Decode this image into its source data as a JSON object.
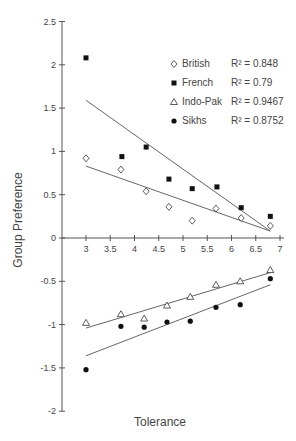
{
  "chart_data": {
    "type": "scatter",
    "title": "",
    "xlabel": "Tolerance",
    "ylabel": "Group Preference",
    "xlim": [
      2.5,
      7
    ],
    "ylim": [
      -2,
      2.5
    ],
    "x_ticks": [
      "3",
      "3.5",
      "4",
      "4.5",
      "5",
      "5.5",
      "6",
      "6.5",
      "7"
    ],
    "y_ticks": [
      "2.5",
      "2",
      "1.5",
      "1",
      "0.5",
      "0",
      "-0.5",
      "-1",
      "-1.5",
      "-2"
    ],
    "grid": false,
    "legend_position": "upper right",
    "series": [
      {
        "name": "British",
        "marker": "open-diamond",
        "r2_label": "R² = 0.848",
        "x": [
          3.0,
          3.72,
          4.24,
          4.71,
          5.19,
          5.68,
          6.2,
          6.8
        ],
        "y": [
          0.92,
          0.79,
          0.54,
          0.36,
          0.2,
          0.34,
          0.23,
          0.14
        ],
        "trend": [
          [
            3.0,
            0.83
          ],
          [
            6.8,
            0.08
          ]
        ]
      },
      {
        "name": "French",
        "marker": "filled-square",
        "r2_label": "R² = 0.79",
        "x": [
          3.0,
          3.74,
          4.24,
          4.71,
          5.19,
          5.7,
          6.2,
          6.8
        ],
        "y": [
          2.08,
          0.94,
          1.05,
          0.68,
          0.57,
          0.59,
          0.35,
          0.25
        ],
        "trend": [
          [
            3.0,
            1.59
          ],
          [
            6.8,
            0.08
          ]
        ]
      },
      {
        "name": "Indo-Pak",
        "marker": "open-triangle",
        "r2_label": "R² = 0.9467",
        "x": [
          3.0,
          3.72,
          4.2,
          4.67,
          5.15,
          5.68,
          6.18,
          6.8
        ],
        "y": [
          -0.98,
          -0.88,
          -0.93,
          -0.78,
          -0.68,
          -0.54,
          -0.5,
          -0.37
        ],
        "trend": [
          [
            3.0,
            -1.04
          ],
          [
            6.8,
            -0.4
          ]
        ]
      },
      {
        "name": "Sikhs",
        "marker": "filled-circle",
        "r2_label": "R² = 0.8752",
        "x": [
          3.0,
          3.72,
          4.2,
          4.67,
          5.15,
          5.68,
          6.18,
          6.8
        ],
        "y": [
          -1.52,
          -1.02,
          -1.03,
          -0.97,
          -0.96,
          -0.8,
          -0.77,
          -0.47
        ],
        "trend": [
          [
            3.0,
            -1.36
          ],
          [
            6.8,
            -0.54
          ]
        ]
      }
    ]
  }
}
